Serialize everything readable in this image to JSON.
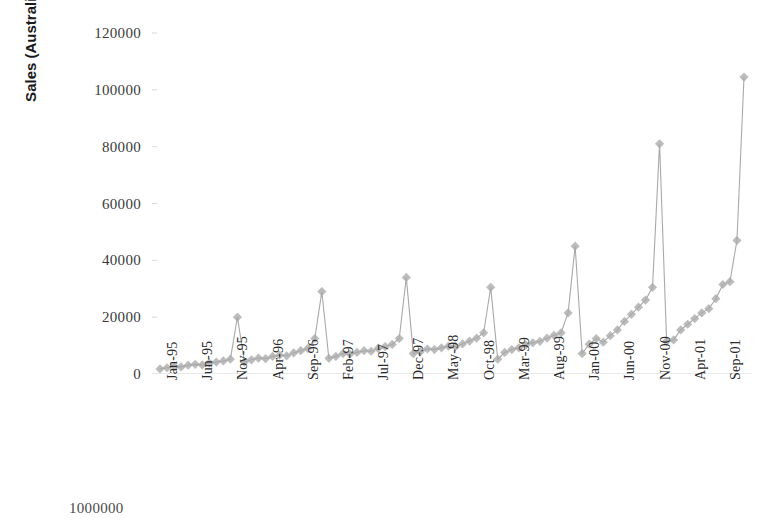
{
  "chart_data": {
    "type": "line",
    "title": "",
    "xlabel": "",
    "ylabel": "Sales (Australian Dollars)",
    "ylim": [
      0,
      120000
    ],
    "ytick_values": [
      0,
      20000,
      40000,
      60000,
      80000,
      100000,
      120000
    ],
    "ytick_labels": [
      "0",
      "20000",
      "40000",
      "60000",
      "80000",
      "100000",
      "120000"
    ],
    "grid": false,
    "legend": "none",
    "marker": "diamond",
    "series_color": "#a9a9a9",
    "xtick_labels": [
      "Jan-95",
      "Jun-95",
      "Nov-95",
      "Apr-96",
      "Sep-96",
      "Feb-97",
      "Jul-97",
      "Dec-97",
      "May-98",
      "Oct-98",
      "Mar-99",
      "Aug-99",
      "Jan-00",
      "Jun-00",
      "Nov-00",
      "Apr-01",
      "Sep-01"
    ],
    "xtick_interval_months": 5,
    "x": [
      "Jan-95",
      "Feb-95",
      "Mar-95",
      "Apr-95",
      "May-95",
      "Jun-95",
      "Jul-95",
      "Aug-95",
      "Sep-95",
      "Oct-95",
      "Nov-95",
      "Dec-95",
      "Jan-96",
      "Feb-96",
      "Mar-96",
      "Apr-96",
      "May-96",
      "Jun-96",
      "Jul-96",
      "Aug-96",
      "Sep-96",
      "Oct-96",
      "Nov-96",
      "Dec-96",
      "Jan-97",
      "Feb-97",
      "Mar-97",
      "Apr-97",
      "May-97",
      "Jun-97",
      "Jul-97",
      "Aug-97",
      "Sep-97",
      "Oct-97",
      "Nov-97",
      "Dec-97",
      "Jan-98",
      "Feb-98",
      "Mar-98",
      "Apr-98",
      "May-98",
      "Jun-98",
      "Jul-98",
      "Aug-98",
      "Sep-98",
      "Oct-98",
      "Nov-98",
      "Dec-98",
      "Jan-99",
      "Feb-99",
      "Mar-99",
      "Apr-99",
      "May-99",
      "Jun-99",
      "Jul-99",
      "Aug-99",
      "Sep-99",
      "Oct-99",
      "Nov-99",
      "Dec-99",
      "Jan-00",
      "Feb-00",
      "Mar-00",
      "Apr-00",
      "May-00",
      "Jun-00",
      "Jul-00",
      "Aug-00",
      "Sep-00",
      "Oct-00",
      "Nov-00",
      "Dec-00",
      "Jan-01",
      "Feb-01",
      "Mar-01",
      "Apr-01",
      "May-01",
      "Jun-01",
      "Jul-01",
      "Aug-01",
      "Sep-01",
      "Oct-01",
      "Nov-01",
      "Dec-01"
    ],
    "values": [
      1800,
      2200,
      2600,
      2500,
      3100,
      3400,
      3200,
      3800,
      4200,
      4600,
      5200,
      20000,
      4200,
      5000,
      5600,
      5400,
      6200,
      6600,
      6400,
      7400,
      8200,
      9000,
      12500,
      29000,
      5500,
      6200,
      7200,
      7000,
      7600,
      8200,
      8000,
      9000,
      9600,
      10400,
      12500,
      34000,
      7200,
      7800,
      8800,
      8600,
      9200,
      9800,
      9600,
      10600,
      11600,
      12600,
      14500,
      30500,
      5200,
      7600,
      8600,
      9200,
      10200,
      11000,
      11500,
      12600,
      13600,
      14500,
      21500,
      45000,
      7200,
      10500,
      12500,
      11200,
      13500,
      15500,
      18500,
      21000,
      23500,
      26000,
      30500,
      81000,
      11500,
      12000,
      15500,
      17500,
      19500,
      21500,
      23000,
      26500,
      31500,
      32500,
      47000,
      104500
    ]
  },
  "next_chart": {
    "top_axis_label": "1000000"
  }
}
